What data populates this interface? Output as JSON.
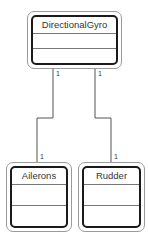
{
  "diagram": {
    "type": "uml-class",
    "classes": [
      {
        "id": "directional-gyro",
        "name": "DirectionalGyro",
        "attributes": [],
        "operations": []
      },
      {
        "id": "ailerons",
        "name": "Ailerons",
        "attributes": [],
        "operations": []
      },
      {
        "id": "rudder",
        "name": "Rudder",
        "attributes": [],
        "operations": []
      }
    ],
    "associations": [
      {
        "from": "DirectionalGyro",
        "to": "Ailerons",
        "from_multiplicity": "1",
        "to_multiplicity": "1"
      },
      {
        "from": "DirectionalGyro",
        "to": "Rudder",
        "from_multiplicity": "1",
        "to_multiplicity": "1"
      }
    ],
    "colors": {
      "line": "#555555",
      "box_border": "#1a1a1a",
      "outer_border": "#9a9a9a"
    }
  }
}
